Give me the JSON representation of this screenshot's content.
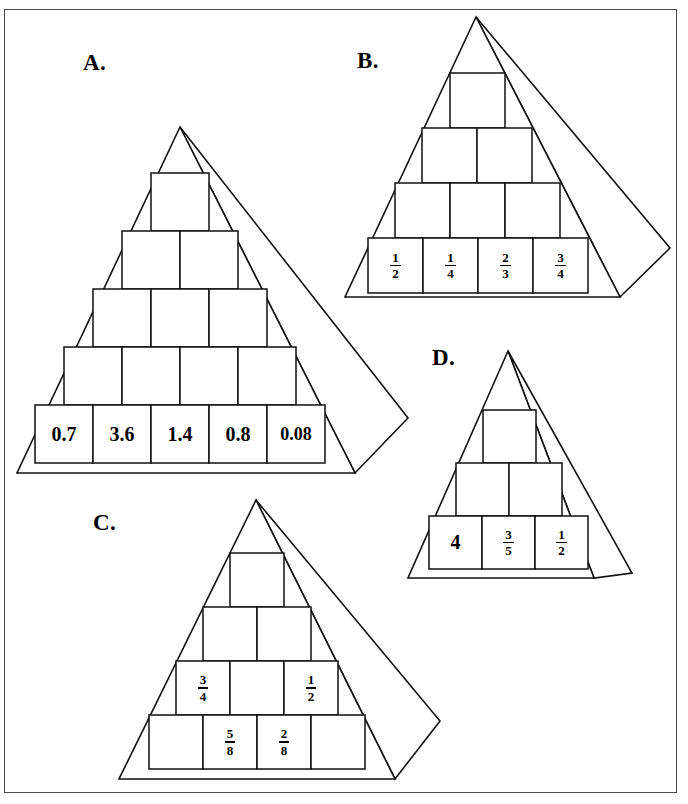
{
  "page": {
    "background_color": "#ffffff",
    "border_color": "#4a4a4a",
    "line_color": "#111111"
  },
  "pyramids": [
    {
      "id": "A",
      "label": "A.",
      "rows": 4,
      "bottom_row_cells": 5,
      "cells": {
        "row1": [
          ""
        ],
        "row2": [
          "",
          ""
        ],
        "row3": [
          "",
          "",
          ""
        ],
        "row4": [
          "0.7",
          "3.6",
          "1.4",
          "0.8",
          "0.08"
        ]
      },
      "filled_values": [
        "0.7",
        "3.6",
        "1.4",
        "0.8",
        "0.08"
      ],
      "value_kind": "decimal"
    },
    {
      "id": "B",
      "label": "B.",
      "rows": 4,
      "bottom_row_cells": 4,
      "cells": {
        "row1": [
          ""
        ],
        "row2": [
          "",
          ""
        ],
        "row3": [
          "",
          "",
          ""
        ],
        "row4": [
          "1/2",
          "1/4",
          "2/3",
          "3/4"
        ]
      },
      "filled_values": [
        "1/2",
        "1/4",
        "2/3",
        "3/4"
      ],
      "value_kind": "fraction"
    },
    {
      "id": "C",
      "label": "C.",
      "rows": 4,
      "bottom_row_cells": 4,
      "cells": {
        "row1": [
          ""
        ],
        "row2": [
          "",
          ""
        ],
        "row3": [
          "3/4",
          "",
          "1/2"
        ],
        "row4": [
          "",
          "5/8",
          "2/8",
          ""
        ]
      },
      "filled_values": [
        "3/4",
        "1/2",
        "5/8",
        "2/8"
      ],
      "value_kind": "fraction"
    },
    {
      "id": "D",
      "label": "D.",
      "rows": 3,
      "bottom_row_cells": 3,
      "cells": {
        "row1": [
          ""
        ],
        "row2": [
          "",
          ""
        ],
        "row3": [
          "4",
          "3/5",
          "1/2"
        ]
      },
      "filled_values": [
        "4",
        "3/5",
        "1/2"
      ],
      "value_kind": "mixed"
    }
  ]
}
